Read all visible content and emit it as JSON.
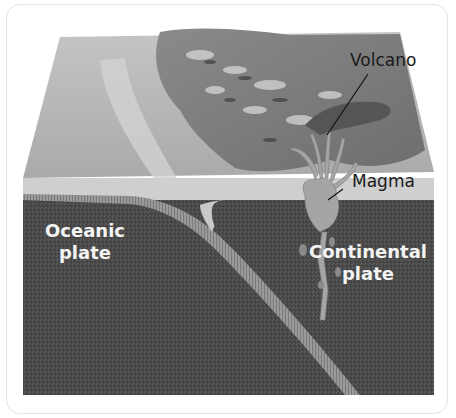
{
  "diagram": {
    "labels": {
      "volcano": "Volcano",
      "magma": "Magma",
      "oceanic_plate_line1": "Oceanic",
      "oceanic_plate_line2": "plate",
      "continental_plate_line1": "Continental",
      "continental_plate_line2": "plate"
    },
    "colors": {
      "background": "#ffffff",
      "surface_top": "#b9b9b9",
      "ocean_layer": "#d0d0d0",
      "plate_dark": "#4a4a4a",
      "slab_edge": "#8f8f8f",
      "magma": "#9a9a9a",
      "label_dark": "#1a1a1a",
      "label_light": "#f4f4f4"
    }
  }
}
